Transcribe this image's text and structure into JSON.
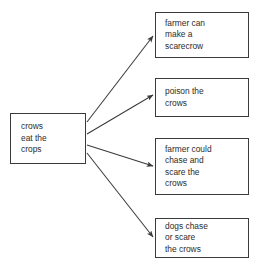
{
  "diagram": {
    "clipped_heading": "Cause and Effect",
    "type": "cause-and-effect-map",
    "ink_color": "#2b2b2b",
    "line_color": "#3a3a3a",
    "background_color": "#ffffff",
    "cause": {
      "id": "crows-eat-crops",
      "text": "crows\neat the\ncrops"
    },
    "effects": [
      {
        "id": "make-scarecrow",
        "text": "farmer can\nmake a\nscarecrow"
      },
      {
        "id": "poison-crows",
        "text": "poison the\ncrows"
      },
      {
        "id": "farmer-chase-scare",
        "text": "farmer could\nchase and\nscare the\ncrows"
      },
      {
        "id": "dogs-chase-scare",
        "text": "dogs chase\nor scare\nthe crows"
      }
    ],
    "connectors": [
      {
        "id": "arrow-to-effect-1",
        "from": "crows-eat-crops",
        "to": "make-scarecrow"
      },
      {
        "id": "arrow-to-effect-2",
        "from": "crows-eat-crops",
        "to": "poison-crows"
      },
      {
        "id": "arrow-to-effect-3",
        "from": "crows-eat-crops",
        "to": "farmer-chase-scare"
      },
      {
        "id": "arrow-to-effect-4",
        "from": "crows-eat-crops",
        "to": "dogs-chase-scare"
      }
    ]
  }
}
